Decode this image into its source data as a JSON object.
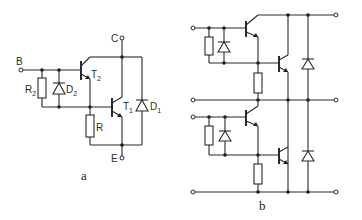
{
  "figure": {
    "panel_a": {
      "caption": "a",
      "terminals": {
        "base": "B",
        "collector": "C",
        "emitter": "E"
      },
      "components": {
        "T1": {
          "letter": "T",
          "sub": "1"
        },
        "T2": {
          "letter": "T",
          "sub": "2"
        },
        "D1": {
          "letter": "D",
          "sub": "1"
        },
        "D2": {
          "letter": "D",
          "sub": "2"
        },
        "R2": {
          "letter": "R",
          "sub": "2"
        },
        "R": {
          "letter": "R"
        }
      }
    },
    "panel_b": {
      "caption": "b"
    },
    "colors": {
      "line": "#2a2a2a",
      "background": "#ffffff"
    }
  }
}
